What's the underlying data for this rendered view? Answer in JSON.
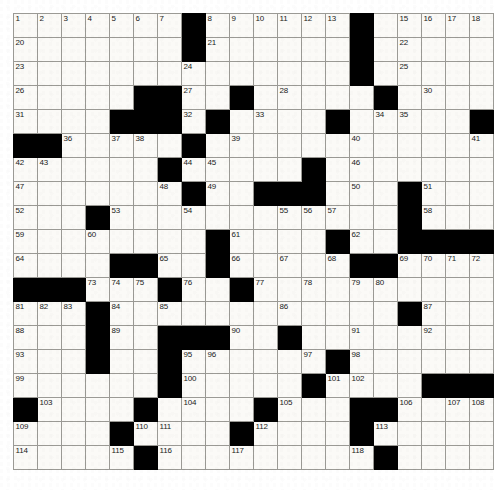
{
  "puzzle": {
    "title": "Crossword Grid",
    "columns": 20,
    "rows": 19,
    "cell_size_px": 24,
    "colors": {
      "block": "#000000",
      "cell": "#fbfaf7",
      "grid_line": "#9b9a95",
      "number_text": "#1a1a1a"
    },
    "caption": "",
    "blocks": [
      [
        0,
        7
      ],
      [
        0,
        14
      ],
      [
        1,
        7
      ],
      [
        1,
        14
      ],
      [
        2,
        14
      ],
      [
        3,
        5
      ],
      [
        3,
        6
      ],
      [
        3,
        9
      ],
      [
        3,
        15
      ],
      [
        4,
        4
      ],
      [
        4,
        5
      ],
      [
        4,
        6
      ],
      [
        4,
        8
      ],
      [
        4,
        13
      ],
      [
        4,
        19
      ],
      [
        5,
        0
      ],
      [
        5,
        1
      ],
      [
        5,
        7
      ],
      [
        6,
        6
      ],
      [
        6,
        12
      ],
      [
        7,
        7
      ],
      [
        7,
        10
      ],
      [
        7,
        11
      ],
      [
        7,
        12
      ],
      [
        7,
        16
      ],
      [
        8,
        3
      ],
      [
        8,
        16
      ],
      [
        9,
        8
      ],
      [
        9,
        13
      ],
      [
        9,
        16
      ],
      [
        9,
        17
      ],
      [
        9,
        18
      ],
      [
        9,
        19
      ],
      [
        10,
        4
      ],
      [
        10,
        5
      ],
      [
        10,
        8
      ],
      [
        10,
        14
      ],
      [
        10,
        15
      ],
      [
        11,
        0
      ],
      [
        11,
        1
      ],
      [
        11,
        2
      ],
      [
        11,
        6
      ],
      [
        11,
        9
      ],
      [
        12,
        3
      ],
      [
        12,
        16
      ],
      [
        13,
        3
      ],
      [
        13,
        6
      ],
      [
        13,
        7
      ],
      [
        13,
        8
      ],
      [
        13,
        11
      ],
      [
        14,
        3
      ],
      [
        14,
        6
      ],
      [
        14,
        13
      ],
      [
        15,
        6
      ],
      [
        15,
        12
      ],
      [
        15,
        17
      ],
      [
        15,
        18
      ],
      [
        15,
        19
      ],
      [
        16,
        0
      ],
      [
        16,
        5
      ],
      [
        16,
        10
      ],
      [
        16,
        14
      ],
      [
        16,
        15
      ],
      [
        17,
        4
      ],
      [
        17,
        9
      ],
      [
        17,
        14
      ],
      [
        18,
        5
      ],
      [
        18,
        15
      ]
    ],
    "numbers": [
      {
        "r": 0,
        "c": 0,
        "n": "1"
      },
      {
        "r": 0,
        "c": 1,
        "n": "2"
      },
      {
        "r": 0,
        "c": 2,
        "n": "3"
      },
      {
        "r": 0,
        "c": 3,
        "n": "4"
      },
      {
        "r": 0,
        "c": 4,
        "n": "5"
      },
      {
        "r": 0,
        "c": 5,
        "n": "6"
      },
      {
        "r": 0,
        "c": 6,
        "n": "7"
      },
      {
        "r": 0,
        "c": 8,
        "n": "8"
      },
      {
        "r": 0,
        "c": 9,
        "n": "9"
      },
      {
        "r": 0,
        "c": 10,
        "n": "10"
      },
      {
        "r": 0,
        "c": 11,
        "n": "11"
      },
      {
        "r": 0,
        "c": 12,
        "n": "12"
      },
      {
        "r": 0,
        "c": 13,
        "n": "13"
      },
      {
        "r": 0,
        "c": 14,
        "n": "14"
      },
      {
        "r": 0,
        "c": 16,
        "n": "15"
      },
      {
        "r": 0,
        "c": 17,
        "n": "16"
      },
      {
        "r": 0,
        "c": 18,
        "n": "17"
      },
      {
        "r": 0,
        "c": 19,
        "n": "18"
      },
      {
        "r": 0,
        "c": 20,
        "n": "19"
      },
      {
        "r": 1,
        "c": 0,
        "n": "20"
      },
      {
        "r": 1,
        "c": 8,
        "n": "21"
      },
      {
        "r": 1,
        "c": 16,
        "n": "22"
      },
      {
        "r": 2,
        "c": 0,
        "n": "23"
      },
      {
        "r": 2,
        "c": 7,
        "n": "24"
      },
      {
        "r": 2,
        "c": 16,
        "n": "25"
      },
      {
        "r": 3,
        "c": 0,
        "n": "26"
      },
      {
        "r": 3,
        "c": 7,
        "n": "27"
      },
      {
        "r": 3,
        "c": 11,
        "n": "28"
      },
      {
        "r": 3,
        "c": 15,
        "n": "29"
      },
      {
        "r": 3,
        "c": 17,
        "n": "30"
      },
      {
        "r": 4,
        "c": 0,
        "n": "31"
      },
      {
        "r": 4,
        "c": 7,
        "n": "32"
      },
      {
        "r": 4,
        "c": 10,
        "n": "33"
      },
      {
        "r": 4,
        "c": 15,
        "n": "34"
      },
      {
        "r": 4,
        "c": 16,
        "n": "35"
      },
      {
        "r": 5,
        "c": 2,
        "n": "36"
      },
      {
        "r": 5,
        "c": 4,
        "n": "37"
      },
      {
        "r": 5,
        "c": 5,
        "n": "38"
      },
      {
        "r": 5,
        "c": 9,
        "n": "39"
      },
      {
        "r": 5,
        "c": 14,
        "n": "40"
      },
      {
        "r": 5,
        "c": 19,
        "n": "41"
      },
      {
        "r": 6,
        "c": 0,
        "n": "42"
      },
      {
        "r": 6,
        "c": 1,
        "n": "43"
      },
      {
        "r": 6,
        "c": 7,
        "n": "44"
      },
      {
        "r": 6,
        "c": 8,
        "n": "45"
      },
      {
        "r": 6,
        "c": 14,
        "n": "46"
      },
      {
        "r": 7,
        "c": 0,
        "n": "47"
      },
      {
        "r": 7,
        "c": 6,
        "n": "48"
      },
      {
        "r": 7,
        "c": 8,
        "n": "49"
      },
      {
        "r": 7,
        "c": 14,
        "n": "50"
      },
      {
        "r": 7,
        "c": 17,
        "n": "51"
      },
      {
        "r": 8,
        "c": 0,
        "n": "52"
      },
      {
        "r": 8,
        "c": 4,
        "n": "53"
      },
      {
        "r": 8,
        "c": 7,
        "n": "54"
      },
      {
        "r": 8,
        "c": 11,
        "n": "55"
      },
      {
        "r": 8,
        "c": 12,
        "n": "56"
      },
      {
        "r": 8,
        "c": 13,
        "n": "57"
      },
      {
        "r": 8,
        "c": 17,
        "n": "58"
      },
      {
        "r": 9,
        "c": 0,
        "n": "59"
      },
      {
        "r": 9,
        "c": 3,
        "n": "60"
      },
      {
        "r": 9,
        "c": 9,
        "n": "61"
      },
      {
        "r": 9,
        "c": 14,
        "n": "62"
      },
      {
        "r": 9,
        "c": 16,
        "n": "63"
      },
      {
        "r": 10,
        "c": 0,
        "n": "64"
      },
      {
        "r": 10,
        "c": 6,
        "n": "65"
      },
      {
        "r": 10,
        "c": 9,
        "n": "66"
      },
      {
        "r": 10,
        "c": 11,
        "n": "67"
      },
      {
        "r": 10,
        "c": 13,
        "n": "68"
      },
      {
        "r": 10,
        "c": 16,
        "n": "69"
      },
      {
        "r": 10,
        "c": 17,
        "n": "70"
      },
      {
        "r": 10,
        "c": 18,
        "n": "71"
      },
      {
        "r": 10,
        "c": 19,
        "n": "72"
      },
      {
        "r": 11,
        "c": 3,
        "n": "73"
      },
      {
        "r": 11,
        "c": 4,
        "n": "74"
      },
      {
        "r": 11,
        "c": 5,
        "n": "75"
      },
      {
        "r": 11,
        "c": 7,
        "n": "76"
      },
      {
        "r": 11,
        "c": 10,
        "n": "77"
      },
      {
        "r": 11,
        "c": 12,
        "n": "78"
      },
      {
        "r": 11,
        "c": 14,
        "n": "79"
      },
      {
        "r": 11,
        "c": 15,
        "n": "80"
      },
      {
        "r": 12,
        "c": 0,
        "n": "81"
      },
      {
        "r": 12,
        "c": 1,
        "n": "82"
      },
      {
        "r": 12,
        "c": 2,
        "n": "83"
      },
      {
        "r": 12,
        "c": 4,
        "n": "84"
      },
      {
        "r": 12,
        "c": 6,
        "n": "85"
      },
      {
        "r": 12,
        "c": 11,
        "n": "86"
      },
      {
        "r": 12,
        "c": 17,
        "n": "87"
      },
      {
        "r": 13,
        "c": 0,
        "n": "88"
      },
      {
        "r": 13,
        "c": 4,
        "n": "89"
      },
      {
        "r": 13,
        "c": 9,
        "n": "90"
      },
      {
        "r": 13,
        "c": 14,
        "n": "91"
      },
      {
        "r": 13,
        "c": 17,
        "n": "92"
      },
      {
        "r": 14,
        "c": 0,
        "n": "93"
      },
      {
        "r": 14,
        "c": 3,
        "n": "94"
      },
      {
        "r": 14,
        "c": 7,
        "n": "95"
      },
      {
        "r": 14,
        "c": 8,
        "n": "96"
      },
      {
        "r": 14,
        "c": 12,
        "n": "97"
      },
      {
        "r": 14,
        "c": 14,
        "n": "98"
      },
      {
        "r": 15,
        "c": 0,
        "n": "99"
      },
      {
        "r": 15,
        "c": 7,
        "n": "100"
      },
      {
        "r": 15,
        "c": 13,
        "n": "101"
      },
      {
        "r": 15,
        "c": 14,
        "n": "102"
      },
      {
        "r": 16,
        "c": 1,
        "n": "103"
      },
      {
        "r": 16,
        "c": 7,
        "n": "104"
      },
      {
        "r": 16,
        "c": 11,
        "n": "105"
      },
      {
        "r": 16,
        "c": 16,
        "n": "106"
      },
      {
        "r": 16,
        "c": 18,
        "n": "107"
      },
      {
        "r": 16,
        "c": 19,
        "n": "108"
      },
      {
        "r": 17,
        "c": 0,
        "n": "109"
      },
      {
        "r": 17,
        "c": 5,
        "n": "110"
      },
      {
        "r": 17,
        "c": 6,
        "n": "111"
      },
      {
        "r": 17,
        "c": 10,
        "n": "112"
      },
      {
        "r": 17,
        "c": 15,
        "n": "113"
      },
      {
        "r": 18,
        "c": 0,
        "n": "114"
      },
      {
        "r": 18,
        "c": 4,
        "n": "115"
      },
      {
        "r": 18,
        "c": 6,
        "n": "116"
      },
      {
        "r": 18,
        "c": 9,
        "n": "117"
      },
      {
        "r": 18,
        "c": 14,
        "n": "118"
      },
      {
        "r": 19,
        "c": 0,
        "n": "119"
      },
      {
        "r": 19,
        "c": 6,
        "n": "120"
      },
      {
        "r": 19,
        "c": 13,
        "n": "121"
      },
      {
        "r": 20,
        "c": 0,
        "n": "122"
      },
      {
        "r": 20,
        "c": 6,
        "n": "123"
      },
      {
        "r": 20,
        "c": 13,
        "n": "124"
      }
    ]
  }
}
